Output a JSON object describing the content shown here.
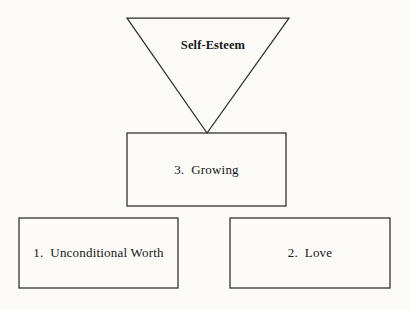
{
  "diagram": {
    "type": "self-esteem-pyramid",
    "background_color": "#fbfaf7",
    "stroke_color": "#2b2b2b",
    "text_color": "#171717",
    "nodes": [
      {
        "id": "self-esteem",
        "shape": "inverted-triangle",
        "label": "Self-Esteem",
        "bold": true,
        "geometry": {
          "x1": 127,
          "y1": 18,
          "x2": 289,
          "y2": 18,
          "apex_x": 207,
          "apex_y": 133
        }
      },
      {
        "id": "growing",
        "shape": "rectangle",
        "label": "3.  Growing",
        "number": "3.",
        "name": "Growing",
        "bold": false,
        "geometry": {
          "x": 127,
          "y": 133,
          "width": 159,
          "height": 73
        }
      },
      {
        "id": "unconditional-worth",
        "shape": "rectangle",
        "label": "1.  Unconditional Worth",
        "number": "1.",
        "name": "Unconditional Worth",
        "bold": false,
        "geometry": {
          "x": 19,
          "y": 218,
          "width": 159,
          "height": 70
        }
      },
      {
        "id": "love",
        "shape": "rectangle",
        "label": "2.  Love",
        "number": "2.",
        "name": "Love",
        "bold": false,
        "geometry": {
          "x": 230,
          "y": 218,
          "width": 160,
          "height": 70
        }
      }
    ]
  }
}
